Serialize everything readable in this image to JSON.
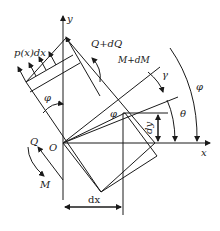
{
  "diagram": {
    "labels": {
      "y_axis": "y",
      "x_axis": "x",
      "origin": "O",
      "load": "p(x)dx",
      "shear_end": "Q+dQ",
      "moment_end": "M+dM",
      "shear_start": "Q",
      "moment_start": "M",
      "phi_left": "φ",
      "phi_mid": "φ",
      "phi_right": "φ",
      "gamma": "γ",
      "theta": "θ",
      "dy": "dy",
      "dx": "dx"
    }
  }
}
